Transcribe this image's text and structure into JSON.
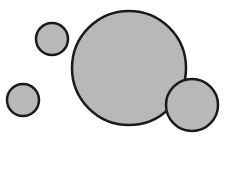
{
  "diagram": {
    "background": "#ffffff",
    "fill_color": "#b8b8b8",
    "stroke_color": "#1a1a1a",
    "circles": [
      {
        "name": "large-circle",
        "cx": 129,
        "cy": 68,
        "r": 57
      },
      {
        "name": "small-circle-top-left",
        "cx": 52,
        "cy": 39,
        "r": 16
      },
      {
        "name": "small-circle-left",
        "cx": 23,
        "cy": 100,
        "r": 16
      },
      {
        "name": "medium-circle-right",
        "cx": 192,
        "cy": 105,
        "r": 26
      }
    ]
  }
}
